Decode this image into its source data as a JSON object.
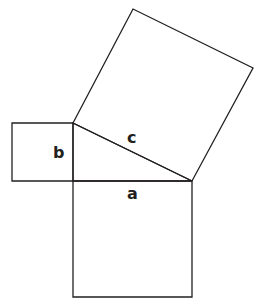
{
  "diagram": {
    "type": "pythagorean-theorem",
    "stroke_color": "#231f20",
    "background": "#ffffff",
    "labels": {
      "a": "a",
      "b": "b",
      "c": "c"
    },
    "shapes": {
      "triangle": [
        [
          73,
          123
        ],
        [
          192,
          181
        ],
        [
          73,
          181
        ]
      ],
      "square_a": [
        [
          73,
          181
        ],
        [
          192,
          181
        ],
        [
          192,
          297
        ],
        [
          73,
          297
        ]
      ],
      "square_b": [
        [
          12,
          123
        ],
        [
          73,
          123
        ],
        [
          73,
          181
        ],
        [
          12,
          181
        ]
      ],
      "square_c": [
        [
          73,
          123
        ],
        [
          133,
          9
        ],
        [
          253,
          68
        ],
        [
          192,
          181
        ]
      ]
    }
  }
}
